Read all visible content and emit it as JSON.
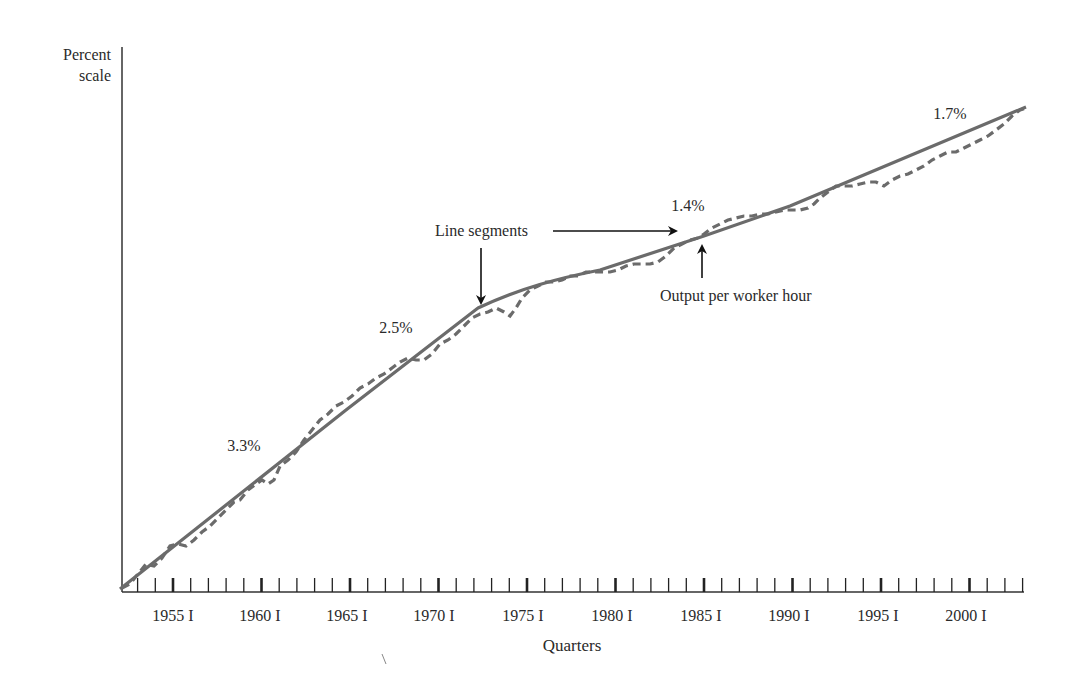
{
  "chart_data": {
    "type": "line",
    "title": "",
    "ylabel": "Percent scale",
    "xlabel": "Quarters",
    "x_ticks": [
      "1955 I",
      "1960 I",
      "1965 I",
      "1970 I",
      "1975 I",
      "1980 I",
      "1985 I",
      "1990 I",
      "1995 I",
      "2000 I"
    ],
    "x_range": [
      "1952 I",
      "2003 IV"
    ],
    "y_scale": "log (percent scale, unlabeled)",
    "grid": false,
    "series": [
      {
        "name": "Line segments",
        "style": "solid",
        "description": "Piecewise-linear trend segments with annual growth rates",
        "segments": [
          {
            "label": "3.3%",
            "from": "1952 I",
            "to": "1965 I"
          },
          {
            "label": "2.5%",
            "from": "1965 I",
            "to": "1973 I"
          },
          {
            "label": "1.4%",
            "from": "1973 I",
            "to": "1990 I"
          },
          {
            "label": "1.7%",
            "from": "1990 I",
            "to": "2003 IV"
          }
        ]
      },
      {
        "name": "Output per worker hour",
        "style": "dashed",
        "description": "Actual quarterly output per worker hour (log scale), closely following the trend segments"
      }
    ],
    "annotations": [
      {
        "text": "3.3%",
        "near": "1957"
      },
      {
        "text": "2.5%",
        "near": "1968"
      },
      {
        "text": "1.4%",
        "near": "1984"
      },
      {
        "text": "1.7%",
        "near": "2000"
      },
      {
        "text": "Line segments",
        "arrows_to": [
          "1973 I",
          "1984 IV"
        ]
      },
      {
        "text": "Output per worker hour",
        "arrow_to": "1985 I"
      }
    ]
  },
  "labels": {
    "y_axis_line1": "Percent",
    "y_axis_line2": "scale",
    "x_axis": "Quarters",
    "rate_1": "3.3%",
    "rate_2": "2.5%",
    "rate_3": "1.4%",
    "rate_4": "1.7%",
    "line_segments": "Line segments",
    "output_per_hour": "Output per worker hour"
  },
  "ticks": {
    "t0": "1955 I",
    "t1": "1960 I",
    "t2": "1965 I",
    "t3": "1970 I",
    "t4": "1975 I",
    "t5": "1980 I",
    "t6": "1985 I",
    "t7": "1990 I",
    "t8": "1995 I",
    "t9": "2000 I"
  },
  "colors": {
    "trend_line": "#6b6b6b",
    "actual_line": "#6b6b6b",
    "axis": "#333333",
    "text": "#2a2a2a"
  }
}
